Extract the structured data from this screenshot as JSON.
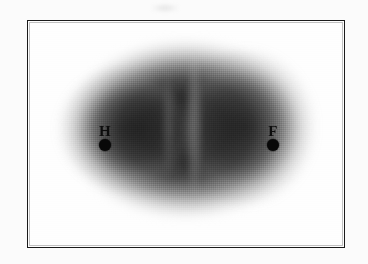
{
  "figure": {
    "type": "grayscale-scan",
    "caption": "",
    "frame": {
      "border_color": "#1a1a1a",
      "background_color": "#fefefe"
    },
    "field": {
      "shape": "ellipse",
      "description": "diffuse dark elliptical density field",
      "core_color": "#1c1c1c",
      "edge_color": "#ffffff"
    },
    "markers": [
      {
        "id": "H",
        "label": "H",
        "marker_shape": "filled-circle",
        "marker_color": "#080808"
      },
      {
        "id": "F",
        "label": "F",
        "marker_shape": "filled-circle",
        "marker_color": "#080808"
      }
    ]
  }
}
